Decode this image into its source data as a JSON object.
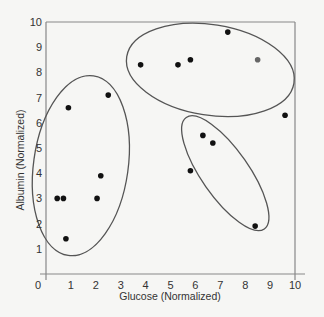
{
  "chart_data": {
    "type": "scatter",
    "title": "",
    "xlabel": "Glucose (Normalized)",
    "ylabel": "Albumin (Normalized)",
    "xlim": [
      0,
      10
    ],
    "ylim": [
      0,
      10
    ],
    "xticks": [
      "0",
      "1",
      "2",
      "3",
      "4",
      "5",
      "6",
      "7",
      "8",
      "9",
      "10"
    ],
    "yticks": [
      "0",
      "1",
      "2",
      "3",
      "4",
      "5",
      "6",
      "7",
      "8",
      "9",
      "10"
    ],
    "grid": false,
    "legend": null,
    "points": [
      {
        "x": 0.9,
        "y": 6.6,
        "cluster": 1
      },
      {
        "x": 2.5,
        "y": 7.1,
        "cluster": 1
      },
      {
        "x": 0.45,
        "y": 3.0,
        "cluster": 1
      },
      {
        "x": 0.7,
        "y": 3.0,
        "cluster": 1
      },
      {
        "x": 2.05,
        "y": 3.0,
        "cluster": 1
      },
      {
        "x": 2.2,
        "y": 3.9,
        "cluster": 1
      },
      {
        "x": 0.8,
        "y": 1.4,
        "cluster": 1
      },
      {
        "x": 3.8,
        "y": 8.3,
        "cluster": 2
      },
      {
        "x": 5.3,
        "y": 8.3,
        "cluster": 2
      },
      {
        "x": 5.8,
        "y": 8.5,
        "cluster": 2
      },
      {
        "x": 7.3,
        "y": 9.6,
        "cluster": 2
      },
      {
        "x": 8.5,
        "y": 8.5,
        "cluster": 2,
        "color": "#666666"
      },
      {
        "x": 9.6,
        "y": 6.3,
        "cluster": 2
      },
      {
        "x": 6.3,
        "y": 5.5,
        "cluster": 3
      },
      {
        "x": 6.7,
        "y": 5.2,
        "cluster": 3
      },
      {
        "x": 5.8,
        "y": 4.1,
        "cluster": 3
      },
      {
        "x": 8.4,
        "y": 1.9,
        "cluster": 3
      }
    ],
    "annotations": [
      {
        "shape": "ellipse",
        "label": "cluster-1",
        "cx": 1.4,
        "cy": 4.3,
        "rx": 1.9,
        "ry": 3.6,
        "rotate": 8
      },
      {
        "shape": "ellipse",
        "label": "cluster-2",
        "cx": 6.6,
        "cy": 8.1,
        "rx": 3.4,
        "ry": 1.8,
        "rotate": 9
      },
      {
        "shape": "ellipse",
        "label": "cluster-3",
        "cx": 7.2,
        "cy": 4.0,
        "rx": 0.95,
        "ry": 2.7,
        "rotate": -35
      }
    ]
  },
  "colors": {
    "background": "#f6f6f4",
    "axis": "#888888",
    "point": "#111111",
    "ellipse": "#555555"
  }
}
